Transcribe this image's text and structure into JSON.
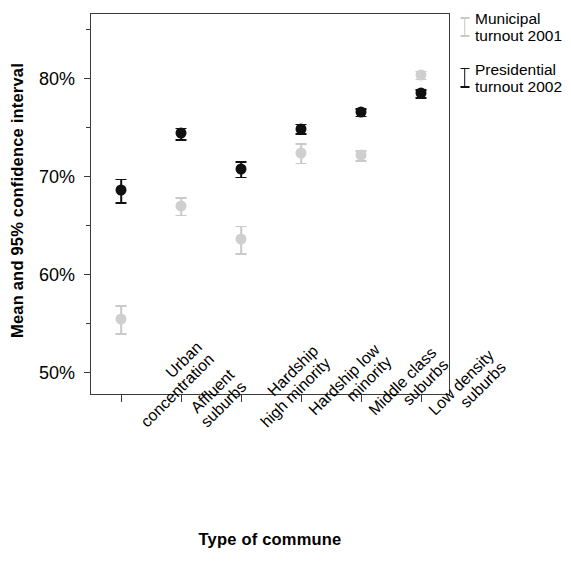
{
  "chart_data": {
    "type": "scatter",
    "title": "",
    "xlabel": "Type of commune",
    "ylabel": "Mean and 95% confidence interval",
    "categories": [
      "Urban concentration",
      "Affluent suburbs",
      "Hardship high minority",
      "Hardship low minority",
      "Middle class suburbs",
      "Low density suburbs"
    ],
    "category_lines": [
      "Urban\nconcentration",
      "Affluent\nsuburbs",
      "Hardship\nhigh minority",
      "Hardship low\nminority",
      "Middle class\nsuburbs",
      "Low density\nsuburbs"
    ],
    "ylim": [
      47.5,
      86.5
    ],
    "ytick_labels": [
      "50%",
      "60%",
      "70%",
      "80%"
    ],
    "ytick_values": [
      50,
      60,
      70,
      80
    ],
    "yminor_values": [
      55,
      65,
      75,
      85
    ],
    "grid": false,
    "legend_position": "right",
    "series": [
      {
        "name": "Municipal turnout 2001",
        "color": "#cfcfcf",
        "values": [
          55.4,
          66.9,
          63.5,
          72.3,
          72.1,
          80.3
        ],
        "ci_low": [
          53.9,
          66.0,
          62.1,
          71.3,
          71.6,
          79.9
        ],
        "ci_high": [
          56.8,
          67.8,
          64.9,
          73.3,
          72.6,
          80.7
        ]
      },
      {
        "name": "Presidential turnout 2002",
        "color": "#101010",
        "values": [
          68.5,
          74.3,
          70.7,
          74.8,
          76.5,
          78.4
        ],
        "ci_low": [
          67.3,
          73.7,
          69.9,
          74.3,
          76.1,
          78.0
        ],
        "ci_high": [
          69.7,
          74.9,
          71.5,
          75.3,
          76.9,
          78.8
        ]
      }
    ]
  },
  "legend": {
    "items": [
      {
        "label": "Municipal\nturnout 2001",
        "tone": "light"
      },
      {
        "label": "Presidential\nturnout 2002",
        "tone": "dark"
      }
    ]
  },
  "axes": {
    "y_title": "Mean and 95% confidence interval",
    "x_title": "Type of commune"
  }
}
